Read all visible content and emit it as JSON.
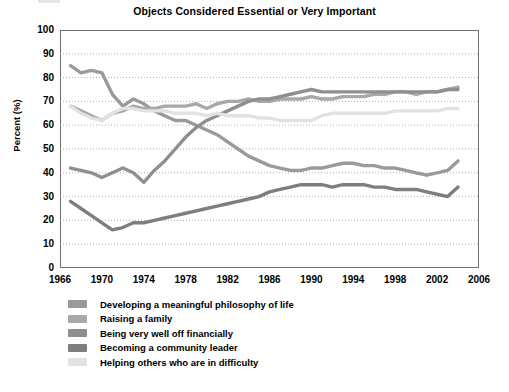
{
  "chart_data": {
    "type": "line",
    "title": "Objects Considered Essential or Very Important",
    "xlabel": "",
    "ylabel": "Percent (%)",
    "xlim": [
      1966,
      2006
    ],
    "ylim": [
      0,
      100
    ],
    "grid": true,
    "legend_position": "bottom-left",
    "xticks": [
      "1966",
      "1970",
      "1974",
      "1978",
      "1982",
      "1986",
      "1990",
      "1994",
      "1998",
      "2002",
      "2006"
    ],
    "yticks": [
      "0",
      "10",
      "20",
      "30",
      "40",
      "50",
      "60",
      "70",
      "80",
      "90",
      "100"
    ],
    "x": [
      1967,
      1968,
      1969,
      1970,
      1971,
      1972,
      1973,
      1974,
      1975,
      1976,
      1977,
      1978,
      1979,
      1980,
      1981,
      1982,
      1983,
      1984,
      1985,
      1986,
      1987,
      1988,
      1989,
      1990,
      1991,
      1992,
      1993,
      1994,
      1995,
      1996,
      1997,
      1998,
      1999,
      2000,
      2001,
      2002,
      2003,
      2004
    ],
    "series": [
      {
        "name": "Developing a meaningful philosophy of life",
        "color": "#9a9a9a",
        "values": [
          85,
          82,
          83,
          82,
          73,
          68,
          71,
          69,
          66,
          64,
          62,
          62,
          60,
          58,
          56,
          53,
          50,
          47,
          45,
          43,
          42,
          41,
          41,
          42,
          42,
          43,
          44,
          44,
          43,
          43,
          42,
          42,
          41,
          40,
          39,
          40,
          41,
          45
        ]
      },
      {
        "name": "Raising a family",
        "color": "#a8a8a8",
        "values": [
          68,
          66,
          64,
          62,
          65,
          66,
          68,
          67,
          67,
          68,
          68,
          68,
          69,
          67,
          69,
          70,
          70,
          71,
          70,
          70,
          71,
          71,
          71,
          72,
          71,
          71,
          72,
          72,
          72,
          73,
          73,
          74,
          74,
          73,
          74,
          74,
          75,
          76
        ]
      },
      {
        "name": "Being very well off financially",
        "color": "#8f8f8f",
        "values": [
          42,
          41,
          40,
          38,
          40,
          42,
          40,
          36,
          41,
          45,
          50,
          55,
          59,
          62,
          64,
          66,
          68,
          70,
          71,
          71,
          72,
          73,
          74,
          75,
          74,
          74,
          74,
          74,
          74,
          74,
          74,
          74,
          74,
          74,
          74,
          74,
          75,
          75
        ]
      },
      {
        "name": "Becoming a community leader",
        "color": "#7e7e7e",
        "values": [
          28,
          25,
          22,
          19,
          16,
          17,
          19,
          19,
          20,
          21,
          22,
          23,
          24,
          25,
          26,
          27,
          28,
          29,
          30,
          32,
          33,
          34,
          35,
          35,
          35,
          34,
          35,
          35,
          35,
          34,
          34,
          33,
          33,
          33,
          32,
          31,
          30,
          34
        ]
      },
      {
        "name": "Helping others who are in difficulty",
        "color": "#e2e2e2",
        "values": [
          68,
          65,
          63,
          62,
          65,
          67,
          67,
          66,
          66,
          66,
          65,
          65,
          65,
          64,
          65,
          64,
          64,
          64,
          63,
          63,
          62,
          62,
          62,
          62,
          64,
          65,
          65,
          65,
          65,
          65,
          65,
          66,
          66,
          66,
          66,
          66,
          67,
          67
        ]
      }
    ]
  },
  "legend": {
    "items": [
      {
        "label": "Developing a meaningful philosophy of life",
        "color": "#9a9a9a"
      },
      {
        "label": "Raising a family",
        "color": "#a8a8a8"
      },
      {
        "label": "Being very well off financially",
        "color": "#8f8f8f"
      },
      {
        "label": "Becoming a community leader",
        "color": "#7e7e7e"
      },
      {
        "label": "Helping others who are in difficulty",
        "color": "#e2e2e2"
      }
    ]
  }
}
